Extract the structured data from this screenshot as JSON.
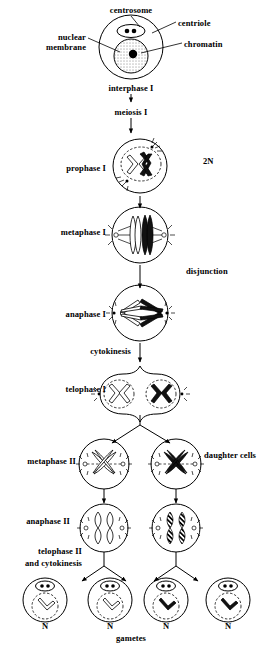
{
  "diagram": {
    "title": "meiosis",
    "ink_color": "#000000",
    "background_color": "#ffffff"
  },
  "callouts": [
    {
      "id": "centrosome",
      "label": "centrosome"
    },
    {
      "id": "centriole",
      "label": "centriole"
    },
    {
      "id": "nuclear-membrane",
      "label_line1": "nuclear",
      "label_line2": "membrane"
    },
    {
      "id": "chromatin",
      "label": "chromatin"
    }
  ],
  "stages": [
    {
      "id": "interphase-1",
      "label": "interphase I"
    },
    {
      "id": "meiosis-1",
      "label": "meiosis I"
    },
    {
      "id": "prophase-1",
      "label": "prophase I",
      "ploidy": "2N"
    },
    {
      "id": "metaphase-1",
      "label": "metaphase I"
    },
    {
      "id": "anaphase-1",
      "label": "anaphase I",
      "note": "disjunction"
    },
    {
      "id": "cytokinesis",
      "label": "cytokinesis"
    },
    {
      "id": "telophase-1",
      "label": "telophase I"
    },
    {
      "id": "metaphase-2",
      "label": "metaphase II",
      "note": "daughter cells"
    },
    {
      "id": "anaphase-2",
      "label": "anaphase II"
    },
    {
      "id": "telophase-2",
      "label_line1": "telophase II",
      "label_line2": "and cytokinesis"
    }
  ],
  "gametes": {
    "label": "gametes",
    "ploidy_labels": [
      "N",
      "N",
      "N",
      "N"
    ]
  }
}
